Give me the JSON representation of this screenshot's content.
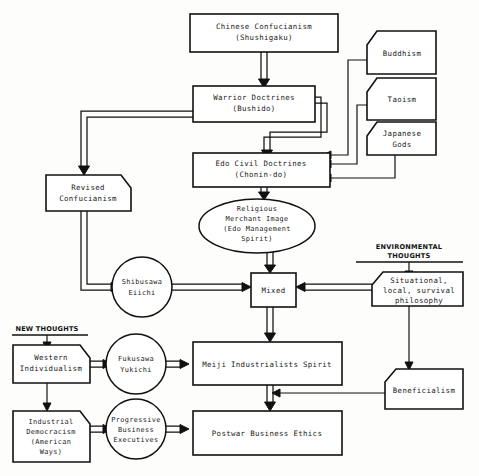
{
  "diagram": {
    "section_labels": [
      {
        "id": "environmental-thoughts",
        "text": "ENVIRONMENTAL\nTHOUGHTS",
        "line1": "ENVIRONMENTAL",
        "line2": "THOUGHTS"
      },
      {
        "id": "new-thoughts",
        "text": "NEW THOUGHTS",
        "line1": "NEW THOUGHTS",
        "line2": ""
      }
    ],
    "nodes": [
      {
        "id": "chinese-confucianism",
        "shape": "rect",
        "lines": [
          "Chinese Confucianism",
          "(Shushigaku)"
        ]
      },
      {
        "id": "buddhism",
        "shape": "pentagon-tl",
        "lines": [
          "Buddhism"
        ]
      },
      {
        "id": "taoism",
        "shape": "pentagon-tl",
        "lines": [
          "Taoism"
        ]
      },
      {
        "id": "japanese-gods",
        "shape": "pentagon-tl",
        "lines": [
          "Japanese",
          "Gods"
        ]
      },
      {
        "id": "warrior-doctrines",
        "shape": "rect",
        "lines": [
          "Warrior Doctrines",
          "(Bushido)"
        ]
      },
      {
        "id": "edo-civil-doctrines",
        "shape": "rect",
        "lines": [
          "Edo Civil Doctrines",
          "(Chonin-do)"
        ]
      },
      {
        "id": "revised-confucianism",
        "shape": "pentagon-tr",
        "lines": [
          "Revised",
          "Confucianism"
        ]
      },
      {
        "id": "religious-merchant-image",
        "shape": "ellipse",
        "lines": [
          "Religious",
          "Merchant Image",
          "(Edo Management",
          "Spirit)"
        ]
      },
      {
        "id": "shibusawa-eiichi",
        "shape": "circle",
        "lines": [
          "Shibusawa",
          "Eiichi"
        ]
      },
      {
        "id": "mixed",
        "shape": "rect",
        "lines": [
          "Mixed"
        ]
      },
      {
        "id": "situational-philosophy",
        "shape": "pentagon-tl",
        "lines": [
          "Situational,",
          "local, survival",
          "philosophy"
        ]
      },
      {
        "id": "western-individualism",
        "shape": "pentagon-tr",
        "lines": [
          "Western",
          "Individualism"
        ]
      },
      {
        "id": "fukusawa-yukichi",
        "shape": "circle",
        "lines": [
          "Fukusawa",
          "Yukichi"
        ]
      },
      {
        "id": "meiji-industrialists-spirit",
        "shape": "rect",
        "lines": [
          "Meiji Industrialists Spirit"
        ]
      },
      {
        "id": "beneficialism",
        "shape": "pentagon-tl",
        "lines": [
          "Beneficialism"
        ]
      },
      {
        "id": "industrial-democracism",
        "shape": "pentagon-tr",
        "lines": [
          "Industrial",
          "Democracism",
          "(American",
          "Ways)"
        ]
      },
      {
        "id": "progressive-business-executives",
        "shape": "circle",
        "lines": [
          "Progressive",
          "Business",
          "Executives"
        ]
      },
      {
        "id": "postwar-business-ethics",
        "shape": "rect",
        "lines": [
          "Postwar Business Ethics"
        ]
      }
    ],
    "edges": [
      {
        "from": "chinese-confucianism",
        "to": "warrior-doctrines",
        "style": "block"
      },
      {
        "from": "warrior-doctrines",
        "to": "edo-civil-doctrines",
        "style": "block"
      },
      {
        "from": "warrior-doctrines",
        "to": "revised-confucianism",
        "style": "block"
      },
      {
        "from": "buddhism",
        "to": "edo-civil-doctrines",
        "style": "thin"
      },
      {
        "from": "taoism",
        "to": "edo-civil-doctrines",
        "style": "thin"
      },
      {
        "from": "japanese-gods",
        "to": "edo-civil-doctrines",
        "style": "thin"
      },
      {
        "from": "edo-civil-doctrines",
        "to": "religious-merchant-image",
        "style": "block"
      },
      {
        "from": "revised-confucianism",
        "to": "shibusawa-eiichi",
        "style": "block"
      },
      {
        "from": "religious-merchant-image",
        "to": "mixed",
        "style": "block"
      },
      {
        "from": "shibusawa-eiichi",
        "to": "mixed",
        "style": "block"
      },
      {
        "from": "situational-philosophy",
        "to": "mixed",
        "style": "block"
      },
      {
        "from": "mixed",
        "to": "meiji-industrialists-spirit",
        "style": "block"
      },
      {
        "from": "western-individualism",
        "to": "fukusawa-yukichi",
        "style": "block"
      },
      {
        "from": "fukusawa-yukichi",
        "to": "meiji-industrialists-spirit",
        "style": "block"
      },
      {
        "from": "western-individualism",
        "to": "industrial-democracism",
        "style": "thin"
      },
      {
        "from": "industrial-democracism",
        "to": "progressive-business-executives",
        "style": "block"
      },
      {
        "from": "progressive-business-executives",
        "to": "postwar-business-ethics",
        "style": "block"
      },
      {
        "from": "meiji-industrialists-spirit",
        "to": "postwar-business-ethics",
        "style": "block"
      },
      {
        "from": "situational-philosophy",
        "to": "beneficialism",
        "style": "thin"
      },
      {
        "from": "beneficialism",
        "to": "postwar-business-ethics",
        "style": "thin"
      }
    ],
    "colors": {
      "stroke": "#111111",
      "fill": "#ffffff",
      "background": "#fdfdfb"
    }
  }
}
